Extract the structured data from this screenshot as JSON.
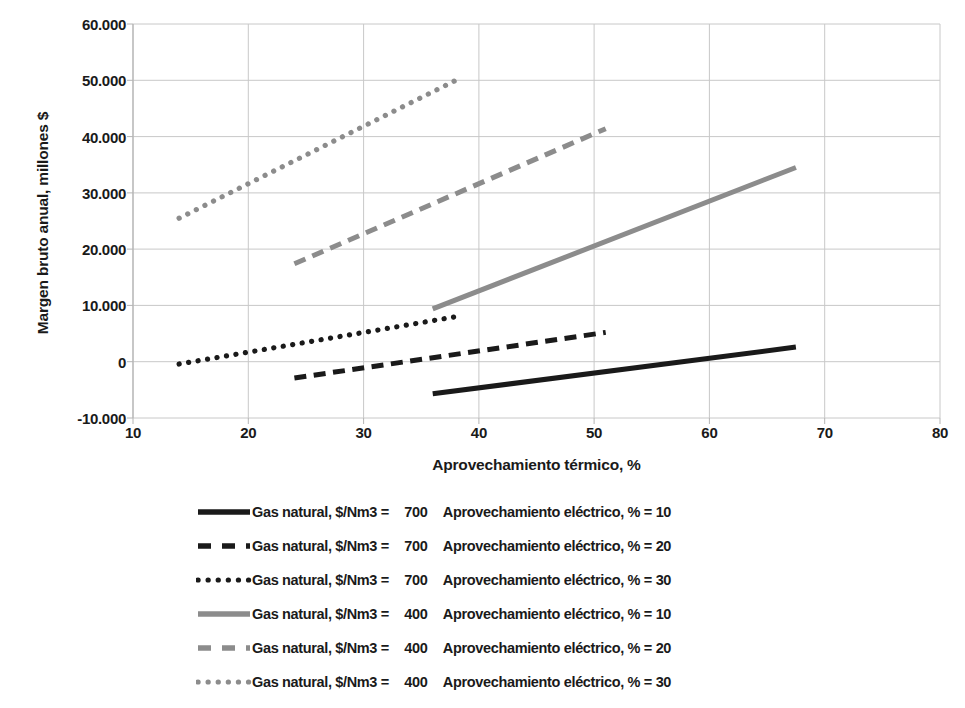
{
  "chart_data": {
    "type": "line",
    "title": "",
    "xlabel": "Aprovechamiento térmico, %",
    "ylabel": "Margen bruto anual, millones $",
    "xlim": [
      10,
      80
    ],
    "ylim": [
      -10000,
      60000
    ],
    "xticks": [
      10,
      20,
      30,
      40,
      50,
      60,
      70,
      80
    ],
    "xtick_labels": [
      "10",
      "20",
      "30",
      "40",
      "50",
      "60",
      "70",
      "80"
    ],
    "yticks": [
      -10000,
      0,
      10000,
      20000,
      30000,
      40000,
      50000,
      60000
    ],
    "ytick_labels": [
      "-10.000",
      "0",
      "10.000",
      "20.000",
      "30.000",
      "40.000",
      "50.000",
      "60.000"
    ],
    "grid": true,
    "legend_position": "bottom",
    "series": [
      {
        "name": "Gas natural, $/Nm3 = 700  Aprovechamiento eléctrico, % = 10",
        "gas_price": "700",
        "elec_pct": "10",
        "color": "#1a1a1a",
        "style": "solid",
        "x": [
          36,
          67.5
        ],
        "y": [
          -5700,
          2600
        ]
      },
      {
        "name": "Gas natural, $/Nm3 = 700  Aprovechamiento eléctrico, % = 20",
        "gas_price": "700",
        "elec_pct": "20",
        "color": "#1a1a1a",
        "style": "dashed",
        "x": [
          24,
          51
        ],
        "y": [
          -2900,
          5200
        ]
      },
      {
        "name": "Gas natural, $/Nm3 = 700  Aprovechamiento eléctrico, % = 30",
        "gas_price": "700",
        "elec_pct": "30",
        "color": "#1a1a1a",
        "style": "dotted",
        "x": [
          14,
          38
        ],
        "y": [
          -400,
          8000
        ]
      },
      {
        "name": "Gas natural, $/Nm3 = 400  Aprovechamiento eléctrico, % = 10",
        "gas_price": "400",
        "elec_pct": "10",
        "color": "#8c8c8c",
        "style": "solid",
        "x": [
          36,
          67.5
        ],
        "y": [
          9400,
          34500
        ]
      },
      {
        "name": "Gas natural, $/Nm3 = 400  Aprovechamiento eléctrico, % = 20",
        "gas_price": "400",
        "elec_pct": "20",
        "color": "#8c8c8c",
        "style": "dashed",
        "x": [
          24,
          51
        ],
        "y": [
          17400,
          41400
        ]
      },
      {
        "name": "Gas natural, $/Nm3 = 400  Aprovechamiento eléctrico, % = 30",
        "gas_price": "400",
        "elec_pct": "30",
        "color": "#8c8c8c",
        "style": "dotted",
        "x": [
          14,
          38
        ],
        "y": [
          25500,
          50000
        ]
      }
    ]
  },
  "legend": {
    "rows": [
      {
        "prefix": "Gas natural, $/Nm3 =",
        "value": "700",
        "suffix": "Aprovechamiento eléctrico, % = 10"
      },
      {
        "prefix": "Gas natural, $/Nm3 =",
        "value": "700",
        "suffix": "Aprovechamiento eléctrico, % = 20"
      },
      {
        "prefix": "Gas natural, $/Nm3 =",
        "value": "700",
        "suffix": "Aprovechamiento eléctrico, % = 30"
      },
      {
        "prefix": "Gas natural, $/Nm3 =",
        "value": "400",
        "suffix": "Aprovechamiento eléctrico, % = 10"
      },
      {
        "prefix": "Gas natural, $/Nm3 =",
        "value": "400",
        "suffix": "Aprovechamiento eléctrico, % = 20"
      },
      {
        "prefix": "Gas natural, $/Nm3 =",
        "value": "400",
        "suffix": "Aprovechamiento eléctrico, % = 30"
      }
    ]
  },
  "style": {
    "gridline_color": "#c8c8c8",
    "axis_color": "#b4b4b4",
    "dark_series_color": "#1a1a1a",
    "gray_series_color": "#8c8c8c",
    "background": "#ffffff"
  }
}
